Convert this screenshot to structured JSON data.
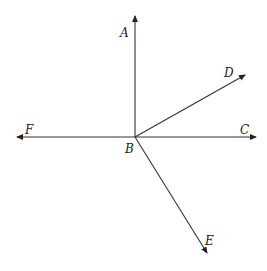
{
  "diagram": {
    "vertex": {
      "name": "B",
      "x": 135,
      "y": 137
    },
    "rays": [
      {
        "name": "A",
        "x": 135,
        "y": 15
      },
      {
        "name": "D",
        "x": 246,
        "y": 74
      },
      {
        "name": "C",
        "x": 257,
        "y": 137
      },
      {
        "name": "F",
        "x": 16,
        "y": 137
      },
      {
        "name": "E",
        "x": 208,
        "y": 255
      }
    ],
    "labels": {
      "A": "A",
      "B": "B",
      "C": "C",
      "D": "D",
      "E": "E",
      "F": "F"
    }
  }
}
